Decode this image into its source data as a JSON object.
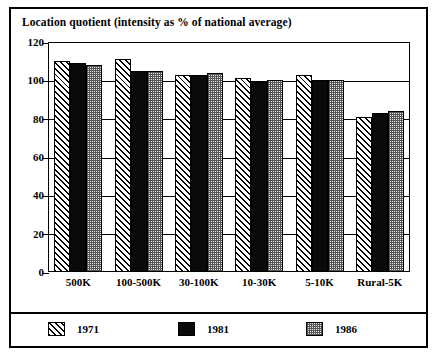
{
  "chart_data": {
    "type": "bar",
    "title": "Location quotient (intensity as % of national average)",
    "xlabel": "",
    "ylabel": "",
    "ylim": [
      0,
      120
    ],
    "yticks": [
      0,
      20,
      40,
      60,
      80,
      100,
      120
    ],
    "grid": true,
    "legend_position": "bottom",
    "categories": [
      "500K",
      "100-500K",
      "30-100K",
      "10-30K",
      "5-10K",
      "Rural-5K"
    ],
    "series": [
      {
        "name": "1971",
        "pattern": "diagonal-hatch",
        "values": [
          110,
          111,
          103,
          101,
          103,
          81
        ]
      },
      {
        "name": "1981",
        "pattern": "solid-black",
        "values": [
          109,
          105,
          103,
          99,
          100,
          83
        ]
      },
      {
        "name": "1986",
        "pattern": "checkerboard",
        "values": [
          108,
          105,
          104,
          100,
          100,
          84
        ]
      }
    ]
  },
  "colors": {
    "frame": "#000000",
    "axis": "#000000",
    "background": "#ffffff",
    "series_1971": "#ffffff",
    "series_1981": "#0a0a0a",
    "series_1986": "#e8e8e8"
  }
}
